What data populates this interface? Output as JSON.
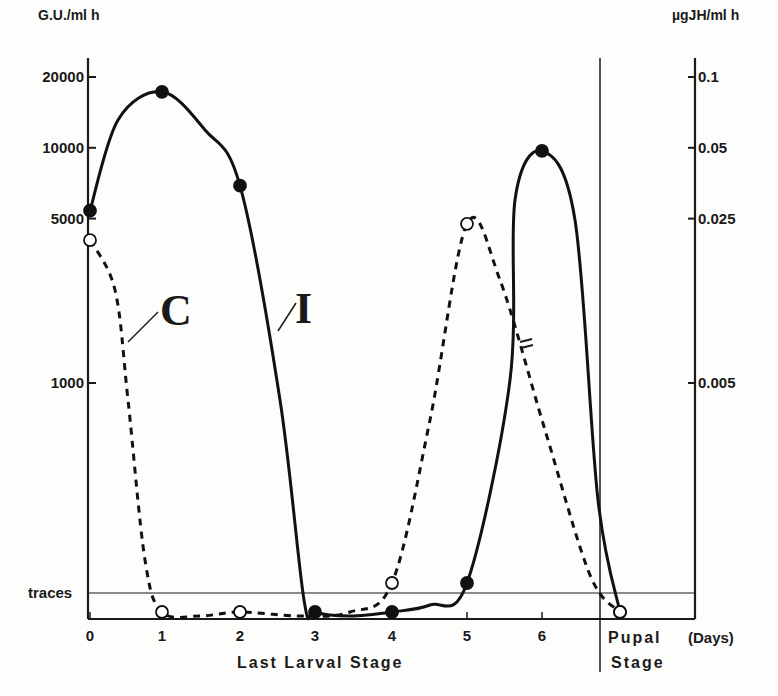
{
  "chart_data": {
    "type": "line",
    "title": "",
    "left_axis_label": "G.U./ml h",
    "right_axis_label": "µgJH/ml h",
    "y_scale": "log",
    "left_ticks": [
      {
        "value": 20000,
        "label": "20000"
      },
      {
        "value": 10000,
        "label": "10000"
      },
      {
        "value": 5000,
        "label": "5000"
      },
      {
        "value": 1000,
        "label": "1000"
      }
    ],
    "right_ticks": [
      {
        "value": 20000,
        "label": "0.1"
      },
      {
        "value": 10000,
        "label": "0.05"
      },
      {
        "value": 5000,
        "label": "0.025"
      },
      {
        "value": 1000,
        "label": "0.005"
      }
    ],
    "traces_label": "traces",
    "x_ticks": [
      "0",
      "1",
      "2",
      "3",
      "4",
      "5",
      "6"
    ],
    "x_unit_label": "(Days)",
    "stage_labels": {
      "larval": "Last Larval Stage",
      "pupal_top": "Pupal",
      "pupal_bottom": "Stage"
    },
    "series": [
      {
        "name": "I",
        "style": "solid",
        "marker": "filled",
        "points": [
          {
            "x": 0,
            "y": 5400
          },
          {
            "x": 1,
            "y": 17300
          },
          {
            "x": 2,
            "y": 6900
          },
          {
            "x": 3,
            "y": "below traces"
          },
          {
            "x": 4,
            "y": "below traces"
          },
          {
            "x": 5,
            "y": "traces"
          },
          {
            "x": 6,
            "y": 9700
          },
          {
            "x": "pupal",
            "y": "below traces"
          }
        ]
      },
      {
        "name": "C",
        "style": "dashed",
        "marker": "open",
        "points": [
          {
            "x": 0,
            "y": 4050
          },
          {
            "x": 1,
            "y": "below traces"
          },
          {
            "x": 2,
            "y": "below traces"
          },
          {
            "x": 4,
            "y": "traces"
          },
          {
            "x": 5,
            "y": 4750
          },
          {
            "x": "pupal",
            "y": "below traces"
          }
        ]
      }
    ],
    "annotations": [
      "C",
      "I"
    ]
  }
}
